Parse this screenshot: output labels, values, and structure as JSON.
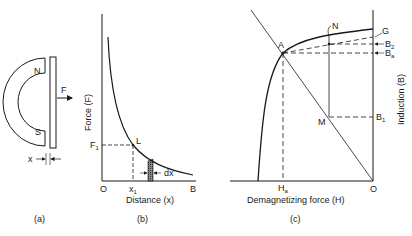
{
  "panels": {
    "a": {
      "caption": "(a)",
      "magnet": {
        "north_label": "N",
        "south_label": "S"
      },
      "force_label": "F",
      "gap_label": "x"
    },
    "b": {
      "caption": "(b)",
      "y_axis_label": "Force (F)",
      "x_axis_label": "Distance (x)",
      "origin_label": "O",
      "x_end_label": "B",
      "point_label": "L",
      "f1_label": "F",
      "f1_sub": "1",
      "x1_label": "x",
      "x1_sub": "1",
      "dx_label": "dx"
    },
    "c": {
      "caption": "(c)",
      "y_axis_label": "Induction (B)",
      "x_axis_label": "Demagnetizing force (H)",
      "origin_label": "O",
      "ha_label": "H",
      "ha_sub": "a",
      "point_a": "A",
      "point_n": "N",
      "point_m": "M",
      "g_label": "G",
      "b2_label": "B",
      "b2_sub": "2",
      "ba_label": "B",
      "ba_sub": "a",
      "b1_label": "B",
      "b1_sub": "1"
    }
  },
  "colors": {
    "ink": "#1a1a1a",
    "background": "#ffffff"
  }
}
